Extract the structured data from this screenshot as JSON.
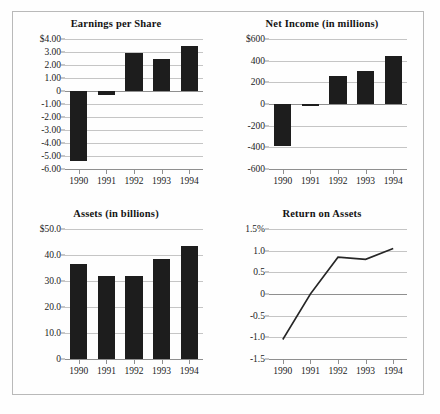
{
  "figure": {
    "panels": [
      {
        "id": "earnings-per-share",
        "title": "Earnings per Share"
      },
      {
        "id": "net-income",
        "title": "Net Income (in millions)"
      },
      {
        "id": "assets",
        "title": "Assets (in billions)"
      },
      {
        "id": "return-on-assets",
        "title": "Return on Assets"
      }
    ]
  },
  "chart_data": [
    {
      "type": "bar",
      "id": "earnings-per-share",
      "title": "Earnings per Share",
      "xlabel": "",
      "ylabel": "",
      "categories": [
        "1990",
        "1991",
        "1992",
        "1993",
        "1994"
      ],
      "values": [
        -5.4,
        -0.3,
        2.9,
        2.5,
        3.5
      ],
      "ylim": [
        -6.0,
        4.0
      ],
      "yticks": [
        4.0,
        3.0,
        2.0,
        1.0,
        0,
        -1.0,
        -2.0,
        -3.0,
        -4.0,
        -5.0,
        -6.0
      ],
      "ytick_labels": [
        "$4.00",
        "3.00",
        "2.00",
        "1.00",
        "0",
        "-1.00",
        "-2.00",
        "-3.00",
        "-4.00",
        "-5.00",
        "-6.00"
      ],
      "grid": true,
      "legend": "none",
      "bar_color": "#1d1d1d"
    },
    {
      "type": "bar",
      "id": "net-income",
      "title": "Net Income (in millions)",
      "xlabel": "",
      "ylabel": "",
      "categories": [
        "1990",
        "1991",
        "1992",
        "1993",
        "1994"
      ],
      "values": [
        -385,
        -15,
        255,
        305,
        445
      ],
      "ylim": [
        -600,
        600
      ],
      "yticks": [
        600,
        400,
        200,
        0,
        -200,
        -400,
        -600
      ],
      "ytick_labels": [
        "$600",
        "400",
        "200",
        "0",
        "-200",
        "-400",
        "-600"
      ],
      "grid": true,
      "legend": "none",
      "bar_color": "#1d1d1d"
    },
    {
      "type": "bar",
      "id": "assets",
      "title": "Assets (in billions)",
      "xlabel": "",
      "ylabel": "",
      "categories": [
        "1990",
        "1991",
        "1992",
        "1993",
        "1994"
      ],
      "values": [
        36.5,
        32.0,
        32.0,
        38.5,
        43.5
      ],
      "ylim": [
        0,
        50.0
      ],
      "yticks": [
        50.0,
        40.0,
        30.0,
        20.0,
        10.0,
        0
      ],
      "ytick_labels": [
        "$50.0",
        "40.0",
        "30.0",
        "20.0",
        "10.0",
        "0"
      ],
      "grid": true,
      "legend": "none",
      "bar_color": "#1d1d1d"
    },
    {
      "type": "line",
      "id": "return-on-assets",
      "title": "Return on Assets",
      "xlabel": "",
      "ylabel": "",
      "categories": [
        "1990",
        "1991",
        "1992",
        "1993",
        "1994"
      ],
      "values": [
        -1.05,
        0.0,
        0.85,
        0.8,
        1.05
      ],
      "ylim": [
        -1.5,
        1.5
      ],
      "yticks": [
        1.5,
        1.0,
        0.5,
        0,
        -0.5,
        -1.0,
        -1.5
      ],
      "ytick_labels": [
        "1.5%",
        "1.0",
        "0.5",
        "0",
        "-0.5",
        "-1.0",
        "-1.5"
      ],
      "grid": true,
      "legend": "none",
      "line_color": "#262626"
    }
  ]
}
